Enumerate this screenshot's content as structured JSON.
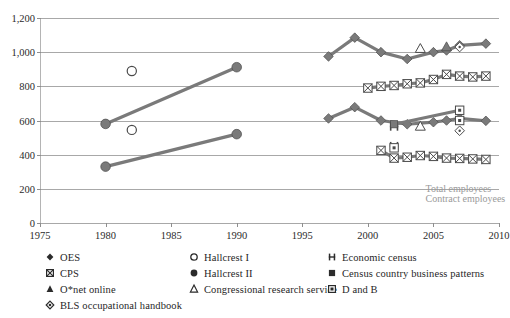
{
  "top_cutoff_text": "",
  "chart_data": {
    "type": "scatter",
    "title": "",
    "xlabel": "",
    "ylabel": "",
    "xlim": [
      1975,
      2010
    ],
    "ylim": [
      0,
      1200
    ],
    "grid": true,
    "legend_position": "bottom",
    "x_ticks": [
      "1975",
      "1980",
      "1985",
      "1990",
      "1995",
      "2000",
      "2005",
      "2010"
    ],
    "x_tick_values": [
      1975,
      1980,
      1985,
      1990,
      1995,
      2000,
      2005,
      2010
    ],
    "y_ticks": [
      "0",
      "200",
      "400",
      "600",
      "800",
      "1,000",
      "1,200"
    ],
    "y_tick_values": [
      0,
      200,
      400,
      600,
      800,
      1000,
      1200
    ],
    "annotations": [
      {
        "text": "Total employees",
        "x": 2004.4,
        "y": 200
      },
      {
        "text": "Contract employees",
        "x": 2004.4,
        "y": 142
      }
    ],
    "series": [
      {
        "name": "OES",
        "marker": "filled-diamond",
        "line": true,
        "points": [
          {
            "x": 1997,
            "y": 975
          },
          {
            "x": 1999,
            "y": 1085
          },
          {
            "x": 2001,
            "y": 1000
          },
          {
            "x": 2003,
            "y": 960
          },
          {
            "x": 2005,
            "y": 1000
          },
          {
            "x": 2006,
            "y": 1010
          },
          {
            "x": 2007,
            "y": 1040
          },
          {
            "x": 2009,
            "y": 1050
          }
        ]
      },
      {
        "name": "OES",
        "marker": "filled-diamond",
        "line": true,
        "points": [
          {
            "x": 1997,
            "y": 612
          },
          {
            "x": 1999,
            "y": 678
          },
          {
            "x": 2001,
            "y": 600
          },
          {
            "x": 2003,
            "y": 578
          },
          {
            "x": 2005,
            "y": 590
          },
          {
            "x": 2006,
            "y": 600
          },
          {
            "x": 2007,
            "y": 612
          },
          {
            "x": 2009,
            "y": 598
          }
        ]
      },
      {
        "name": "CPS",
        "marker": "square-x",
        "line": true,
        "points": [
          {
            "x": 2000,
            "y": 790
          },
          {
            "x": 2001,
            "y": 800
          },
          {
            "x": 2002,
            "y": 805
          },
          {
            "x": 2003,
            "y": 815
          },
          {
            "x": 2004,
            "y": 820
          },
          {
            "x": 2005,
            "y": 840
          },
          {
            "x": 2006,
            "y": 870
          },
          {
            "x": 2007,
            "y": 860
          },
          {
            "x": 2008,
            "y": 855
          },
          {
            "x": 2009,
            "y": 860
          }
        ]
      },
      {
        "name": "CPS",
        "marker": "square-x",
        "line": true,
        "points": [
          {
            "x": 2001,
            "y": 425
          },
          {
            "x": 2002,
            "y": 380
          },
          {
            "x": 2003,
            "y": 385
          },
          {
            "x": 2004,
            "y": 395
          },
          {
            "x": 2005,
            "y": 390
          },
          {
            "x": 2006,
            "y": 380
          },
          {
            "x": 2007,
            "y": 378
          },
          {
            "x": 2008,
            "y": 375
          },
          {
            "x": 2009,
            "y": 372
          }
        ]
      },
      {
        "name": "Hallcrest I",
        "marker": "open-circle",
        "line": false,
        "points": [
          {
            "x": 1982,
            "y": 890
          },
          {
            "x": 1982,
            "y": 545
          }
        ]
      },
      {
        "name": "Hallcrest II",
        "marker": "filled-circle",
        "line": true,
        "points": [
          {
            "x": 1980,
            "y": 580
          },
          {
            "x": 1990,
            "y": 912
          }
        ]
      },
      {
        "name": "Hallcrest II (contract)",
        "marker": "filled-circle",
        "line": true,
        "points": [
          {
            "x": 1980,
            "y": 330
          },
          {
            "x": 1990,
            "y": 520
          }
        ]
      },
      {
        "name": "Congressional research service",
        "marker": "open-triangle",
        "line": false,
        "points": [
          {
            "x": 2004,
            "y": 1020
          },
          {
            "x": 2004,
            "y": 565
          }
        ]
      },
      {
        "name": "O*net online",
        "marker": "filled-triangle",
        "line": false,
        "points": [
          {
            "x": 2006,
            "y": 1030
          }
        ]
      },
      {
        "name": "BLS occupational handbook",
        "marker": "open-diamond-dot",
        "line": false,
        "points": [
          {
            "x": 2007,
            "y": 1030
          },
          {
            "x": 2007,
            "y": 540
          }
        ]
      },
      {
        "name": "Economic census",
        "marker": "h-bar",
        "line": false,
        "points": [
          {
            "x": 2002,
            "y": 565
          },
          {
            "x": 2002,
            "y": 450
          }
        ]
      },
      {
        "name": "Census country business patterns",
        "marker": "filled-square",
        "line": true,
        "points": [
          {
            "x": 2002,
            "y": 578
          },
          {
            "x": 2007,
            "y": 660
          }
        ]
      },
      {
        "name": "D and B",
        "marker": "square-dot",
        "line": false,
        "points": [
          {
            "x": 2007,
            "y": 660
          },
          {
            "x": 2007,
            "y": 600
          },
          {
            "x": 2002,
            "y": 440
          }
        ]
      }
    ]
  },
  "legend": {
    "columns": [
      {
        "items": [
          {
            "marker": "filled-diamond",
            "label": "OES"
          },
          {
            "marker": "square-x",
            "label": "CPS"
          },
          {
            "marker": "filled-triangle",
            "label": "O*net online"
          },
          {
            "marker": "open-diamond-dot",
            "label": "BLS occupational handbook"
          }
        ]
      },
      {
        "items": [
          {
            "marker": "open-circle",
            "label": "Hallcrest I"
          },
          {
            "marker": "filled-circle",
            "label": "Hallcrest II"
          },
          {
            "marker": "open-triangle",
            "label": "Congressional research service"
          }
        ]
      },
      {
        "items": [
          {
            "marker": "h-bar",
            "label": "Economic census"
          },
          {
            "marker": "filled-square",
            "label": "Census country business patterns"
          },
          {
            "marker": "square-dot",
            "label": "D and B"
          }
        ]
      }
    ]
  },
  "colors": {
    "series_gray": "#7a7a7a",
    "marker_dark": "#4a4a4a",
    "gridline": "#a8a8a8",
    "annotation_gray": "#9a9a9a",
    "text": "#1f1f1f"
  }
}
